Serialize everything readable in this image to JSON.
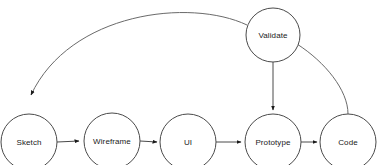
{
  "diagram": {
    "type": "flow-diagram",
    "canvas": {
      "width": 378,
      "height": 165,
      "background": "#ffffff"
    },
    "stroke_color": "#4a4a4a",
    "label_color": "#1a1a1a",
    "nodes": [
      {
        "id": "sketch",
        "label": "Sketch",
        "cx": 29,
        "cy": 142,
        "r": 28
      },
      {
        "id": "wireframe",
        "label": "Wireframe",
        "cx": 112,
        "cy": 141,
        "r": 28
      },
      {
        "id": "ui",
        "label": "UI",
        "cx": 188,
        "cy": 142,
        "r": 28
      },
      {
        "id": "prototype",
        "label": "Prototype",
        "cx": 273,
        "cy": 142,
        "r": 28
      },
      {
        "id": "code",
        "label": "Code",
        "cx": 348,
        "cy": 142,
        "r": 28
      },
      {
        "id": "validate",
        "label": "Validate",
        "cx": 273,
        "cy": 35,
        "r": 27
      }
    ],
    "edges": [
      {
        "id": "sketch-to-wireframe",
        "from": "sketch",
        "to": "wireframe",
        "style": "straight",
        "arrow": true
      },
      {
        "id": "wireframe-to-ui",
        "from": "wireframe",
        "to": "ui",
        "style": "straight",
        "arrow": true
      },
      {
        "id": "ui-to-prototype",
        "from": "ui",
        "to": "prototype",
        "style": "straight",
        "arrow": true
      },
      {
        "id": "prototype-to-code",
        "from": "prototype",
        "to": "code",
        "style": "straight",
        "arrow": true
      },
      {
        "id": "validate-to-prototype",
        "from": "validate",
        "to": "prototype",
        "style": "straight-vertical",
        "arrow": true
      },
      {
        "id": "validate-to-sketch",
        "from": "validate",
        "to": "sketch",
        "style": "curve",
        "arrow": true
      },
      {
        "id": "code-to-validate",
        "from": "code",
        "to": "validate",
        "style": "curve",
        "arrow": false
      }
    ]
  }
}
